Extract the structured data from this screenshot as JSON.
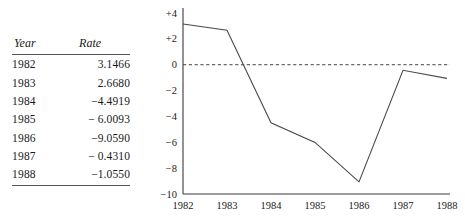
{
  "table": {
    "columns": [
      "Year",
      "Rate"
    ],
    "rows": [
      {
        "year": "1982",
        "rate": "3.1466"
      },
      {
        "year": "1983",
        "rate": "2.6680"
      },
      {
        "year": "1984",
        "rate": "−4.4919"
      },
      {
        "year": "1985",
        "rate": "− 6.0093"
      },
      {
        "year": "1986",
        "rate": "−9.0590"
      },
      {
        "year": "1987",
        "rate": "− 0.4310"
      },
      {
        "year": "1988",
        "rate": "−1.0550"
      }
    ]
  },
  "chart_data": {
    "type": "line",
    "title": "",
    "xlabel": "",
    "ylabel": "",
    "categories": [
      "1982",
      "1983",
      "1984",
      "1985",
      "1986",
      "1987",
      "1988"
    ],
    "x": [
      1982,
      1983,
      1984,
      1985,
      1986,
      1987,
      1988
    ],
    "values": [
      3.1466,
      2.668,
      -4.4919,
      -6.0093,
      -9.059,
      -0.431,
      -1.055
    ],
    "series": [
      {
        "name": "Rate",
        "values": [
          3.1466,
          2.668,
          -4.4919,
          -6.0093,
          -9.059,
          -0.431,
          -1.055
        ]
      }
    ],
    "ylim": [
      -10,
      4
    ],
    "xlim": [
      1982,
      1988
    ],
    "yticks": [
      4,
      2,
      0,
      -2,
      -4,
      -6,
      -8,
      -10
    ],
    "ytick_labels": [
      "+4",
      "+2",
      "0",
      "−2",
      "−4",
      "−6",
      "−8",
      "−10"
    ],
    "xtick_labels": [
      "1982",
      "1983",
      "1984",
      "1985",
      "1986",
      "1987",
      "1988"
    ],
    "grid": false,
    "legend": "none",
    "reference_line": {
      "value": 0,
      "style": "dashed"
    },
    "line_color": "#4a4a4a",
    "axis_color": "#3a3a3a"
  }
}
